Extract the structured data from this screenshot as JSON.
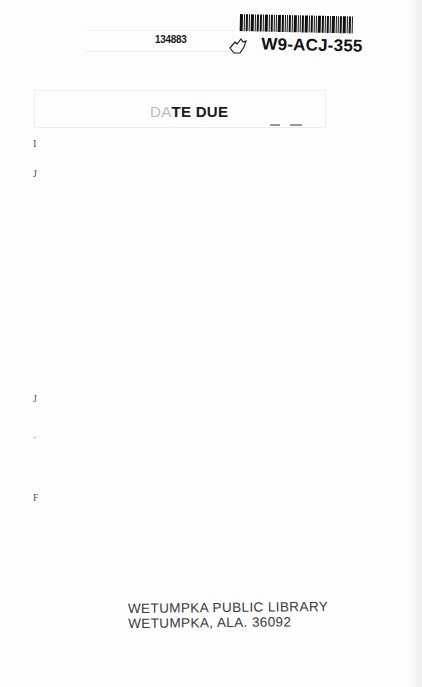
{
  "header": {
    "accession_number": "134883",
    "barcode_id": "W9-ACJ-355",
    "barcode_bars": [
      3,
      1,
      2,
      1,
      3,
      1,
      2,
      2,
      1,
      3,
      1,
      2,
      1,
      1,
      3,
      2,
      1,
      1,
      2,
      1,
      3,
      1,
      1,
      2,
      3,
      1,
      2,
      1,
      1,
      3,
      2,
      1,
      2,
      1,
      3,
      1,
      1,
      2,
      3,
      1,
      2,
      1
    ]
  },
  "date_due_slip": {
    "label_faded": "DA",
    "label_visible": "TE DUE"
  },
  "margin_marks": [
    {
      "text": "I",
      "top": 138
    },
    {
      "text": "J",
      "top": 168
    },
    {
      "text": "J",
      "top": 393
    },
    {
      "text": "·",
      "top": 432
    },
    {
      "text": "F",
      "top": 492
    }
  ],
  "library_stamp": {
    "line1": "WETUMPKA PUBLIC LIBRARY",
    "line2": "WETUMPKA, ALA. 36092"
  }
}
